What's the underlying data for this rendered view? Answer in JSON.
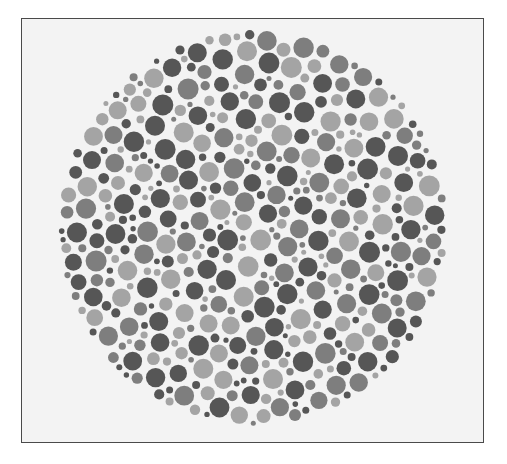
{
  "figure": {
    "type": "color-vision test plate (Ishihara-style, grayscale reproduction)",
    "frame": {
      "border_color": "#4a4a4a",
      "background": "#f3f3f3"
    },
    "plate": {
      "center_x": 253,
      "center_y": 228,
      "radius_x": 195,
      "radius_y": 198,
      "dot_colors": [
        "#565656",
        "#7e7e7e",
        "#a4a4a4"
      ],
      "dot_min_radius": 2.5,
      "dot_max_radius": 10.5,
      "gap": 1.6
    }
  }
}
